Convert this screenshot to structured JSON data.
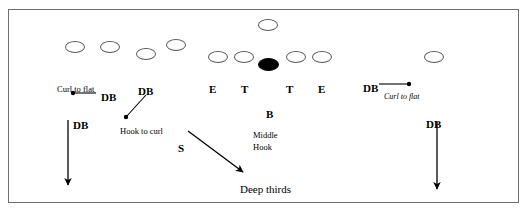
{
  "diagram": {
    "frame": {
      "x": 8,
      "y": 9,
      "width": 511,
      "height": 194,
      "border_color": "#6e6e6e",
      "background": "#ffffff"
    },
    "ink_color": "#000000",
    "outline_color": "#5a5a5a",
    "players": [
      {
        "name": "offense-player-top-center",
        "shape": "ellipse",
        "filled": false,
        "x": 257,
        "y": 18,
        "w": 20,
        "h": 12
      },
      {
        "name": "offense-player-left-wide",
        "shape": "ellipse",
        "filled": false,
        "x": 64,
        "y": 40,
        "w": 20,
        "h": 12
      },
      {
        "name": "offense-player-left-slot",
        "shape": "ellipse",
        "filled": false,
        "x": 99,
        "y": 40,
        "w": 20,
        "h": 12
      },
      {
        "name": "offense-player-left-inside",
        "shape": "ellipse",
        "filled": false,
        "x": 135,
        "y": 47,
        "w": 20,
        "h": 12
      },
      {
        "name": "offense-player-left-high",
        "shape": "ellipse",
        "filled": false,
        "x": 165,
        "y": 38,
        "w": 20,
        "h": 12
      },
      {
        "name": "offense-lineman-left-end",
        "shape": "ellipse",
        "filled": false,
        "x": 207,
        "y": 50,
        "w": 20,
        "h": 12
      },
      {
        "name": "offense-lineman-left-tackle",
        "shape": "ellipse",
        "filled": false,
        "x": 233,
        "y": 50,
        "w": 20,
        "h": 12
      },
      {
        "name": "football-center",
        "shape": "ellipse",
        "filled": true,
        "x": 257,
        "y": 57,
        "w": 21,
        "h": 13
      },
      {
        "name": "offense-lineman-right-tackle",
        "shape": "ellipse",
        "filled": false,
        "x": 285,
        "y": 50,
        "w": 20,
        "h": 12
      },
      {
        "name": "offense-lineman-right-end",
        "shape": "ellipse",
        "filled": false,
        "x": 311,
        "y": 50,
        "w": 20,
        "h": 12
      },
      {
        "name": "offense-player-right-wide",
        "shape": "ellipse",
        "filled": false,
        "x": 423,
        "y": 50,
        "w": 20,
        "h": 12
      }
    ],
    "position_labels": [
      {
        "name": "position-label-db-left-flat",
        "text": "DB",
        "x": 100,
        "y": 91
      },
      {
        "name": "position-label-db-left-hook",
        "text": "DB",
        "x": 137,
        "y": 85
      },
      {
        "name": "position-label-e-left",
        "text": "E",
        "x": 208,
        "y": 83
      },
      {
        "name": "position-label-t-left",
        "text": "T",
        "x": 240,
        "y": 83
      },
      {
        "name": "position-label-t-right",
        "text": "T",
        "x": 285,
        "y": 83
      },
      {
        "name": "position-label-e-right",
        "text": "E",
        "x": 317,
        "y": 83
      },
      {
        "name": "position-label-db-right-flat",
        "text": "DB",
        "x": 362,
        "y": 82
      },
      {
        "name": "position-label-b-middle",
        "text": "B",
        "x": 265,
        "y": 108
      },
      {
        "name": "position-label-db-left-deep",
        "text": "DB",
        "x": 72,
        "y": 119
      },
      {
        "name": "position-label-s-safety",
        "text": "S",
        "x": 177,
        "y": 142
      },
      {
        "name": "position-label-db-right-deep",
        "text": "DB",
        "x": 425,
        "y": 118
      }
    ],
    "zone_labels": [
      {
        "name": "zone-label-curl-to-flat-left",
        "text": "Curl to flat",
        "x": 56,
        "y": 84,
        "style": "zone"
      },
      {
        "name": "zone-label-curl-to-flat-right",
        "text": "Curl to flat",
        "x": 383,
        "y": 92,
        "style": "zone-ital"
      },
      {
        "name": "zone-label-hook-to-curl",
        "text": "Hook to curl",
        "x": 119,
        "y": 126,
        "style": "zone"
      },
      {
        "name": "zone-label-middle",
        "text": "Middle",
        "x": 252,
        "y": 130,
        "style": "zone"
      },
      {
        "name": "zone-label-hook",
        "text": "Hook",
        "x": 252,
        "y": 142,
        "style": "zone"
      },
      {
        "name": "zone-label-deep-thirds",
        "text": "Deep thirds",
        "x": 239,
        "y": 183,
        "style": "deep"
      }
    ],
    "routes": [
      {
        "name": "route-curl-to-flat-left",
        "kind": "line-with-dot",
        "x1": 96,
        "y1": 93,
        "x2": 73,
        "y2": 93,
        "dot_x": 73,
        "dot_y": 93,
        "dot_r": 2.2
      },
      {
        "name": "route-hook-to-curl-left",
        "kind": "line-with-dot",
        "x1": 146,
        "y1": 95,
        "x2": 126,
        "y2": 117,
        "dot_x": 126,
        "dot_y": 117,
        "dot_r": 2.2
      },
      {
        "name": "route-curl-to-flat-right",
        "kind": "line-with-dot",
        "x1": 379,
        "y1": 84,
        "x2": 409,
        "y2": 84,
        "dot_x": 409,
        "dot_y": 84,
        "dot_r": 2.2
      },
      {
        "name": "route-deep-third-left",
        "kind": "arrow",
        "x1": 68,
        "y1": 120,
        "x2": 68,
        "y2": 185
      },
      {
        "name": "route-deep-third-right",
        "kind": "arrow",
        "x1": 437,
        "y1": 122,
        "x2": 437,
        "y2": 189
      },
      {
        "name": "route-safety-deep-thirds",
        "kind": "arrow",
        "x1": 188,
        "y1": 131,
        "x2": 243,
        "y2": 172
      }
    ]
  }
}
